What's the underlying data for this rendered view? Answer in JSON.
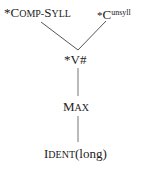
{
  "diagram": {
    "type": "constraint-ranking-hasse",
    "nodes": [
      {
        "id": "comp_syll",
        "prefix": "*",
        "cap": "C",
        "smallcaps": "OMP-",
        "cap2": "S",
        "smallcaps2": "YLL",
        "label": "*Comp-Syll"
      },
      {
        "id": "c_unsyll",
        "prefix": "*",
        "base": "C",
        "sup": "unsyll",
        "label": "*C^unsyll"
      },
      {
        "id": "v_hash",
        "label": "*V#"
      },
      {
        "id": "max",
        "cap": "M",
        "smallcaps": "AX",
        "label": "Max"
      },
      {
        "id": "ident_long",
        "cap": "I",
        "smallcaps": "DENT",
        "rest": "(long)",
        "label": "Ident(long)"
      }
    ],
    "edges": [
      {
        "from": "comp_syll",
        "to": "v_hash"
      },
      {
        "from": "c_unsyll",
        "to": "v_hash"
      },
      {
        "from": "v_hash",
        "to": "max"
      },
      {
        "from": "max",
        "to": "ident_long"
      }
    ],
    "line_color": "#555555"
  }
}
